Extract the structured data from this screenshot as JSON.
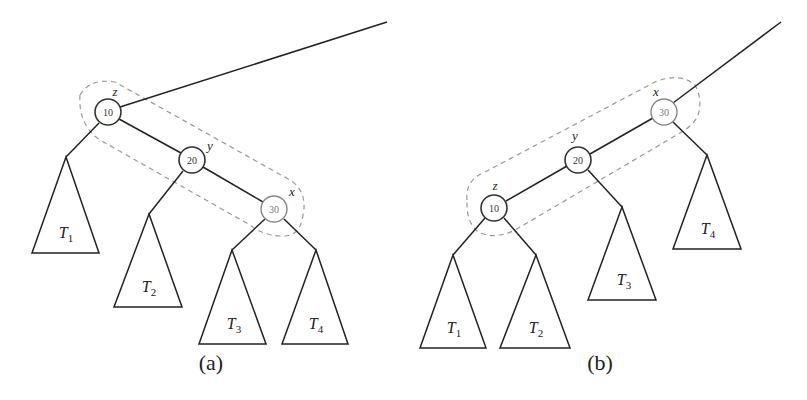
{
  "panels": {
    "a": {
      "caption": "(a)",
      "nodes": [
        {
          "id": "z",
          "key": "10",
          "label": "z"
        },
        {
          "id": "y",
          "key": "20",
          "label": "y"
        },
        {
          "id": "x",
          "key": "30",
          "label": "x"
        }
      ],
      "subtrees": [
        {
          "name": "T",
          "sub": "1"
        },
        {
          "name": "T",
          "sub": "2"
        },
        {
          "name": "T",
          "sub": "3"
        },
        {
          "name": "T",
          "sub": "4"
        }
      ]
    },
    "b": {
      "caption": "(b)",
      "nodes": [
        {
          "id": "x",
          "key": "30",
          "label": "x"
        },
        {
          "id": "y",
          "key": "20",
          "label": "y"
        },
        {
          "id": "z",
          "key": "10",
          "label": "z"
        }
      ],
      "subtrees": [
        {
          "name": "T",
          "sub": "1"
        },
        {
          "name": "T",
          "sub": "2"
        },
        {
          "name": "T",
          "sub": "3"
        },
        {
          "name": "T",
          "sub": "4"
        }
      ]
    }
  }
}
